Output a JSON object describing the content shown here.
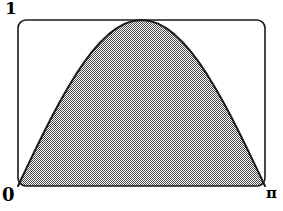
{
  "figure": {
    "title": "",
    "labels": {
      "y_max": "1",
      "origin": "0",
      "x_max": "π"
    },
    "colors": {
      "stroke": "#1a1a1a",
      "fill": "#808080",
      "background": "#ffffff"
    }
  },
  "chart_data": {
    "type": "area",
    "title": "",
    "xlabel": "",
    "ylabel": "",
    "xlim": [
      0,
      3.14159265
    ],
    "ylim": [
      0,
      1
    ],
    "xtick_labels": [
      "0",
      "π"
    ],
    "ytick_labels": [
      "0",
      "1"
    ],
    "grid": false,
    "legend": null,
    "fill_pattern": "50% gray dither",
    "series": [
      {
        "name": "sin(x)",
        "expression": "sin(x)",
        "x": [
          0.0,
          0.10472,
          0.20944,
          0.31416,
          0.41888,
          0.5236,
          0.62832,
          0.73304,
          0.83776,
          0.94248,
          1.0472,
          1.15192,
          1.25664,
          1.36136,
          1.46608,
          1.5708,
          1.67552,
          1.78024,
          1.88496,
          1.98968,
          2.0944,
          2.19911,
          2.30383,
          2.40855,
          2.51327,
          2.61799,
          2.72271,
          2.82743,
          2.93215,
          3.03687,
          3.14159
        ],
        "y": [
          0.0,
          0.10453,
          0.20791,
          0.30902,
          0.40674,
          0.5,
          0.58779,
          0.66913,
          0.74314,
          0.80902,
          0.86603,
          0.91355,
          0.95106,
          0.97815,
          0.99452,
          1.0,
          0.99452,
          0.97815,
          0.95106,
          0.91355,
          0.86603,
          0.80902,
          0.74314,
          0.66913,
          0.58779,
          0.5,
          0.40674,
          0.30902,
          0.20791,
          0.10453,
          0.0
        ]
      }
    ]
  }
}
